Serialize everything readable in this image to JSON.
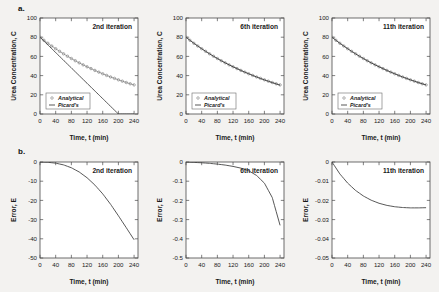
{
  "figure": {
    "panel_a_label": "a.",
    "panel_b_label": "b."
  },
  "axis_labels": {
    "x": "Time, t (min)",
    "y_top": "Urea Concentration, C",
    "y_bottom": "Error, E"
  },
  "legend": {
    "analytical": "Analytical",
    "picards": "Picard's"
  },
  "colors": {
    "curve": "#3a3a3a",
    "marker": "#6f6f6f",
    "axis": "#4a4a4a",
    "background": "#f3f2f0",
    "plot_background": "#ffffff"
  },
  "chart_data": [
    {
      "id": "a1",
      "type": "line",
      "title": "2nd iteration",
      "xlabel": "Time, t (min)",
      "ylabel": "Urea Concentration, C",
      "xlim": [
        0,
        250
      ],
      "ylim": [
        0,
        100
      ],
      "xticks": [
        0,
        40,
        80,
        120,
        160,
        200,
        240
      ],
      "yticks": [
        0,
        20,
        40,
        60,
        80,
        100
      ],
      "grid": false,
      "legend": [
        "Analytical",
        "Picard's"
      ],
      "legend_position": "lower-left",
      "x": [
        0,
        10,
        20,
        30,
        40,
        50,
        60,
        70,
        80,
        90,
        100,
        110,
        120,
        130,
        140,
        150,
        160,
        170,
        180,
        190,
        200,
        210,
        220,
        230,
        240
      ],
      "series": [
        {
          "name": "Analytical",
          "style": "markers",
          "values": [
            80.0,
            76.8,
            73.7,
            70.8,
            68.0,
            65.3,
            62.7,
            60.2,
            57.8,
            55.5,
            53.3,
            51.2,
            49.2,
            47.3,
            45.4,
            43.6,
            41.9,
            40.2,
            38.6,
            37.1,
            35.6,
            34.2,
            32.8,
            31.5,
            30.3
          ]
        },
        {
          "name": "Picard's",
          "style": "line",
          "values": [
            80.0,
            76.0,
            72.0,
            68.0,
            64.0,
            60.0,
            56.0,
            52.0,
            48.0,
            44.0,
            40.0,
            36.0,
            32.0,
            28.0,
            24.0,
            20.0,
            16.0,
            12.0,
            8.0,
            4.0,
            0.0,
            0.0,
            0.0,
            0.0,
            0.0
          ]
        }
      ]
    },
    {
      "id": "a2",
      "type": "line",
      "title": "6th iteration",
      "xlabel": "Time, t (min)",
      "ylabel": "Urea Concentration, C",
      "xlim": [
        0,
        250
      ],
      "ylim": [
        0,
        100
      ],
      "xticks": [
        0,
        40,
        80,
        120,
        160,
        200,
        240
      ],
      "yticks": [
        0,
        20,
        40,
        60,
        80,
        100
      ],
      "grid": false,
      "legend": [
        "Analytical",
        "Picard's"
      ],
      "legend_position": "lower-left",
      "x": [
        0,
        10,
        20,
        30,
        40,
        50,
        60,
        70,
        80,
        90,
        100,
        110,
        120,
        130,
        140,
        150,
        160,
        170,
        180,
        190,
        200,
        210,
        220,
        230,
        240
      ],
      "series": [
        {
          "name": "Analytical",
          "style": "markers",
          "values": [
            80.0,
            76.8,
            73.7,
            70.8,
            68.0,
            65.3,
            62.7,
            60.2,
            57.8,
            55.5,
            53.3,
            51.2,
            49.2,
            47.3,
            45.4,
            43.6,
            41.9,
            40.2,
            38.6,
            37.1,
            35.6,
            34.2,
            32.8,
            31.5,
            30.3
          ]
        },
        {
          "name": "Picard's",
          "style": "line",
          "values": [
            80.0,
            76.8,
            73.7,
            70.8,
            68.0,
            65.3,
            62.7,
            60.2,
            57.8,
            55.5,
            53.3,
            51.2,
            49.2,
            47.3,
            45.4,
            43.6,
            41.9,
            40.2,
            38.6,
            37.0,
            35.5,
            34.1,
            32.7,
            31.3,
            30.0
          ]
        }
      ]
    },
    {
      "id": "a3",
      "type": "line",
      "title": "11th iteration",
      "xlabel": "Time, t (min)",
      "ylabel": "Urea Concentration, C",
      "xlim": [
        0,
        250
      ],
      "ylim": [
        0,
        100
      ],
      "xticks": [
        0,
        40,
        80,
        120,
        160,
        200,
        240
      ],
      "yticks": [
        0,
        20,
        40,
        60,
        80,
        100
      ],
      "grid": false,
      "legend": [
        "Analytical",
        "Picard's"
      ],
      "legend_position": "lower-left",
      "x": [
        0,
        10,
        20,
        30,
        40,
        50,
        60,
        70,
        80,
        90,
        100,
        110,
        120,
        130,
        140,
        150,
        160,
        170,
        180,
        190,
        200,
        210,
        220,
        230,
        240
      ],
      "series": [
        {
          "name": "Analytical",
          "style": "markers",
          "values": [
            80.0,
            76.8,
            73.7,
            70.8,
            68.0,
            65.3,
            62.7,
            60.2,
            57.8,
            55.5,
            53.3,
            51.2,
            49.2,
            47.3,
            45.4,
            43.6,
            41.9,
            40.2,
            38.6,
            37.1,
            35.6,
            34.2,
            32.8,
            31.5,
            30.3
          ]
        },
        {
          "name": "Picard's",
          "style": "line",
          "values": [
            80.0,
            76.8,
            73.7,
            70.8,
            68.0,
            65.3,
            62.7,
            60.2,
            57.8,
            55.5,
            53.3,
            51.2,
            49.2,
            47.3,
            45.4,
            43.6,
            41.9,
            40.2,
            38.6,
            37.1,
            35.6,
            34.2,
            32.8,
            31.5,
            30.3
          ]
        }
      ]
    },
    {
      "id": "b1",
      "type": "line",
      "title": "2nd iteration",
      "xlabel": "Time, t (min)",
      "ylabel": "Error, E",
      "xlim": [
        0,
        250
      ],
      "ylim": [
        -50,
        0
      ],
      "xticks": [
        0,
        40,
        80,
        120,
        160,
        200,
        240
      ],
      "yticks": [
        0,
        -10,
        -20,
        -30,
        -40,
        -50
      ],
      "grid": false,
      "x": [
        0,
        20,
        40,
        60,
        80,
        100,
        120,
        140,
        160,
        180,
        200,
        220,
        240
      ],
      "series": [
        {
          "name": "Error",
          "style": "line",
          "values": [
            0.0,
            -0.15,
            -0.6,
            -1.5,
            -3.0,
            -5.2,
            -8.2,
            -12.0,
            -16.6,
            -22.0,
            -28.0,
            -34.2,
            -40.5
          ]
        }
      ]
    },
    {
      "id": "b2",
      "type": "line",
      "title": "6th iteration",
      "xlabel": "Time, t (min)",
      "ylabel": "Error, E",
      "xlim": [
        0,
        250
      ],
      "ylim": [
        -0.5,
        0
      ],
      "xticks": [
        0,
        40,
        80,
        120,
        160,
        200,
        240
      ],
      "yticks": [
        0,
        -0.1,
        -0.2,
        -0.3,
        -0.4,
        -0.5
      ],
      "grid": false,
      "x": [
        0,
        20,
        40,
        60,
        80,
        100,
        120,
        140,
        160,
        180,
        200,
        220,
        240
      ],
      "series": [
        {
          "name": "Error",
          "style": "line",
          "values": [
            0.0,
            -0.002,
            -0.004,
            -0.007,
            -0.011,
            -0.016,
            -0.023,
            -0.032,
            -0.046,
            -0.07,
            -0.11,
            -0.185,
            -0.33
          ]
        }
      ]
    },
    {
      "id": "b3",
      "type": "line",
      "title": "11th iteration",
      "xlabel": "Time, t (min)",
      "ylabel": "Error, E",
      "xlim": [
        0,
        250
      ],
      "ylim": [
        -0.05,
        0
      ],
      "xticks": [
        0,
        40,
        80,
        120,
        160,
        200,
        240
      ],
      "yticks": [
        0,
        -0.01,
        -0.02,
        -0.03,
        -0.04,
        -0.05
      ],
      "grid": false,
      "x": [
        0,
        20,
        40,
        60,
        80,
        100,
        120,
        140,
        160,
        180,
        200,
        220,
        240
      ],
      "series": [
        {
          "name": "Error",
          "style": "line",
          "values": [
            0.0,
            -0.0062,
            -0.011,
            -0.0148,
            -0.0177,
            -0.0199,
            -0.0215,
            -0.0226,
            -0.0233,
            -0.0237,
            -0.0239,
            -0.0239,
            -0.0238
          ]
        }
      ]
    }
  ]
}
